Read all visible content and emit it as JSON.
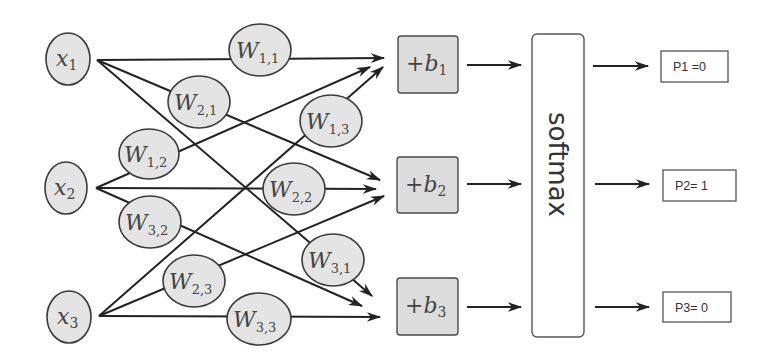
{
  "diagram": {
    "type": "softmax-layer-network",
    "inputs": [
      {
        "id": "x1",
        "base": "x",
        "sub": "1"
      },
      {
        "id": "x2",
        "base": "x",
        "sub": "2"
      },
      {
        "id": "x3",
        "base": "x",
        "sub": "3"
      }
    ],
    "weights": [
      {
        "id": "W11",
        "base": "W",
        "sub": "1,1",
        "from": "x1",
        "to": "b1"
      },
      {
        "id": "W21",
        "base": "W",
        "sub": "2,1",
        "from": "x1",
        "to": "b2"
      },
      {
        "id": "W31",
        "base": "W",
        "sub": "3,1",
        "from": "x1",
        "to": "b3"
      },
      {
        "id": "W12",
        "base": "W",
        "sub": "1,2",
        "from": "x2",
        "to": "b1"
      },
      {
        "id": "W22",
        "base": "W",
        "sub": "2,2",
        "from": "x2",
        "to": "b2"
      },
      {
        "id": "W32",
        "base": "W",
        "sub": "3,2",
        "from": "x2",
        "to": "b3"
      },
      {
        "id": "W13",
        "base": "W",
        "sub": "1,3",
        "from": "x3",
        "to": "b1"
      },
      {
        "id": "W23",
        "base": "W",
        "sub": "2,3",
        "from": "x3",
        "to": "b2"
      },
      {
        "id": "W33",
        "base": "W",
        "sub": "3,3",
        "from": "x3",
        "to": "b3"
      }
    ],
    "biases": [
      {
        "id": "b1",
        "prefix": "+",
        "base": "b",
        "sub": "1"
      },
      {
        "id": "b2",
        "prefix": "+",
        "base": "b",
        "sub": "2"
      },
      {
        "id": "b3",
        "prefix": "+",
        "base": "b",
        "sub": "3"
      }
    ],
    "softmax": {
      "label": "softmax"
    },
    "outputs": [
      {
        "id": "P1",
        "label": "P1 =0"
      },
      {
        "id": "P2",
        "label": "P2= 1"
      },
      {
        "id": "P3",
        "label": "P3= 0"
      }
    ],
    "colors": {
      "node_fill": "#e4e4e4",
      "bias_fill": "#dcdcdc",
      "stroke": "#222222",
      "background": "#ffffff"
    }
  }
}
